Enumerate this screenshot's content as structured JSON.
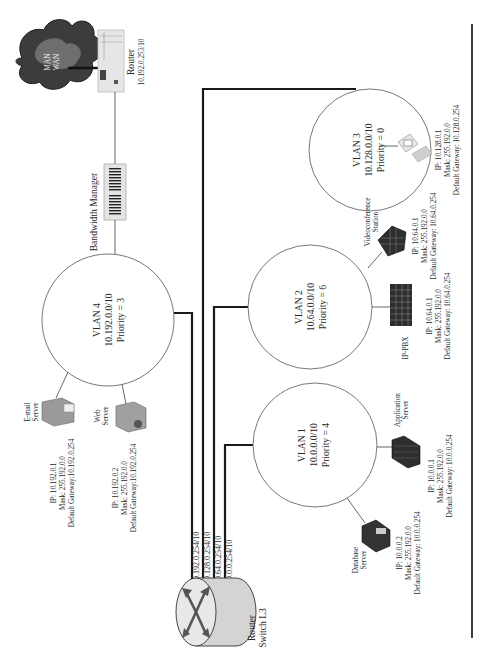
{
  "diagram": {
    "orientation": "rotated-90-ccw",
    "wan_cloud": {
      "label_line1": "MAN",
      "label_line2": "WAN"
    },
    "edge_router": {
      "label": "Router",
      "address": "10.192.0.253/10"
    },
    "bandwidth_manager": {
      "label": "Bandwidth Manager"
    },
    "core_router": {
      "label_line1": "Router",
      "label_line2": "Switch L3"
    },
    "router_interfaces": [
      {
        "label": "10.192.0.254/10"
      },
      {
        "label": "10.128.0.254/10"
      },
      {
        "label": "10.64.0.254/10"
      },
      {
        "label": "10.0.0.254/10"
      }
    ],
    "vlans": [
      {
        "name": "VLAN 1",
        "subnet": "10.0.0.0/10",
        "priority": "Priority = 4"
      },
      {
        "name": "VLAN 2",
        "subnet": "10.64.0.0/10",
        "priority": "Priority = 6"
      },
      {
        "name": "VLAN 3",
        "subnet": "10.128.0.0/10",
        "priority": "Priority = 0"
      },
      {
        "name": "VLAN 4",
        "subnet": "10.192.0.0/10",
        "priority": "Priority = 3"
      }
    ],
    "hosts": {
      "email_server": {
        "label_line1": "E-mail",
        "label_line2": "Server",
        "ip": "IP: 10.192.0.1",
        "mask": "Mask: 255.192.0.0",
        "gateway": "Default Gateway:10.192.0.254"
      },
      "web_server": {
        "label_line1": "Web",
        "label_line2": "Server",
        "ip": "IP: 10.192.0.2",
        "mask": "Mask: 255.192.0.0",
        "gateway": "Default Gateway:10.192.0.254"
      },
      "database_server": {
        "label_line1": "Database",
        "label_line2": "Server",
        "ip": "IP: 10.0.0.2",
        "mask": "Mask: 255.192.0.0",
        "gateway": "Default Gateway: 10.0.0.254"
      },
      "application_server": {
        "label_line1": "Application",
        "label_line2": "Server",
        "ip": "IP: 10.0.0.1",
        "mask": "Mask: 255.192.0.0",
        "gateway": "Default Gateway: 10.0.0.254"
      },
      "ip_pbx": {
        "label_line1": "IP-PBX",
        "ip": "IP: 10.64.0.1",
        "mask": "Mask: 255.192.0.0",
        "gateway": "Default Gateway: 10.64.0.254"
      },
      "videoconference_station": {
        "label_line1": "Videoconference",
        "label_line2": "Station",
        "ip": "IP: 10.64.0.1",
        "mask": "Mask: 255.192.0.0",
        "gateway": "Default Gateway: 10.64.0.254"
      },
      "vlan3_workstation": {
        "ip": "IP: 10.128.0.1",
        "mask": "Mask: 255.192.0.0",
        "gateway": "Default Gateway: 10.128.0.254"
      }
    },
    "colors": {
      "trunk_line": "#1a1a1a",
      "link_line": "#555555",
      "cloud": "#3c3c3c",
      "device_dark": "#2e2e2e",
      "device_light": "#d8d8d8"
    }
  }
}
